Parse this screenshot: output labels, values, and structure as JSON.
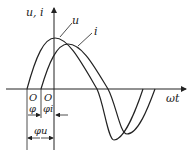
{
  "diagram": {
    "title": "",
    "y_axis_label": "u, i",
    "x_axis_label": "ωt",
    "curves": [
      {
        "name": "u",
        "label": "u"
      },
      {
        "name": "i",
        "label": "i"
      }
    ],
    "origin_labels": {
      "u_origin": "O",
      "i_origin": "O"
    },
    "angle_labels": {
      "phi": "φ",
      "phi_i": "φi",
      "phi_u": "φu"
    },
    "line_color": "#222222"
  }
}
